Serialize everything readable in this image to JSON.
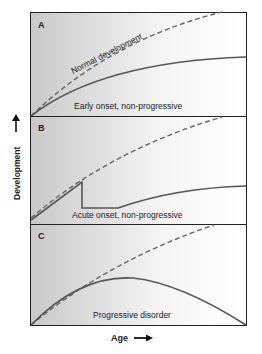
{
  "figure": {
    "y_axis_label": "Development",
    "x_axis_label": "Age",
    "panels": [
      {
        "id": "A",
        "letter": "A",
        "caption": "Early onset, non-progressive",
        "reference_label": "Normal development"
      },
      {
        "id": "B",
        "letter": "B",
        "caption": "Acute onset, non-progressive"
      },
      {
        "id": "C",
        "letter": "C",
        "caption": "Progressive disorder"
      }
    ],
    "legend": {
      "dashed_line": "Normal development trajectory",
      "solid_line": "Affected development trajectory"
    },
    "colors": {
      "solid_curve": "#555555",
      "dashed_curve": "#666666",
      "panel_border": "#222222",
      "shade_dark": "#c8c8c8",
      "shade_light": "#ffffff"
    }
  }
}
